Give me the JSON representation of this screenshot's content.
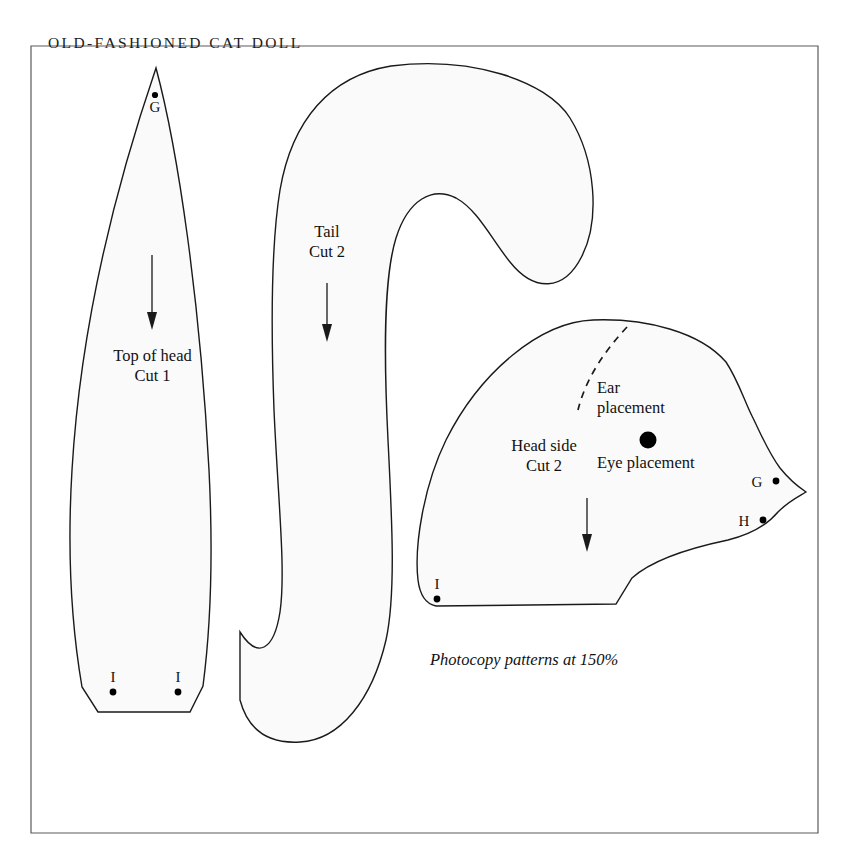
{
  "document": {
    "title": "OLD-FASHIONED CAT DOLL",
    "kind": "sewing-pattern-sheet",
    "instruction": "Photocopy patterns at 150%",
    "line_color": "#1a1a1a",
    "piece_fill": "#fafafa",
    "border_color": "#5a5a5a"
  },
  "pieces": [
    {
      "id": "top-of-head",
      "name": "Top of head",
      "cut": "Cut 1",
      "label_line1": "Top of head",
      "label_line2": "Cut 1",
      "grain": "down",
      "markers": [
        {
          "letter": "G",
          "position": "apex",
          "dot": "above-letter"
        },
        {
          "letter": "I",
          "position": "bottom-left",
          "dot": "below-letter"
        },
        {
          "letter": "I",
          "position": "bottom-right",
          "dot": "below-letter"
        }
      ]
    },
    {
      "id": "tail",
      "name": "Tail",
      "cut": "Cut 2",
      "label_line1": "Tail",
      "label_line2": "Cut 2",
      "grain": "down",
      "markers": []
    },
    {
      "id": "head-side",
      "name": "Head side",
      "cut": "Cut 2",
      "label_line1": "Head side",
      "label_line2": "Cut 2",
      "grain": "down",
      "markers": [
        {
          "letter": "G",
          "position": "muzzle-upper",
          "dot": "right-of-letter"
        },
        {
          "letter": "H",
          "position": "muzzle-lower",
          "dot": "right-of-letter"
        },
        {
          "letter": "I",
          "position": "bottom-left",
          "dot": "below-letter"
        }
      ],
      "notes": [
        {
          "id": "ear-placement",
          "line1": "Ear",
          "line2": "placement",
          "marker": "dashed-curve"
        },
        {
          "id": "eye-placement",
          "line1": "Eye placement",
          "marker": "filled-dot"
        }
      ]
    }
  ]
}
